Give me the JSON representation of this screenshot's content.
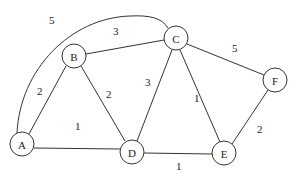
{
  "graph": {
    "nodes": [
      {
        "id": "A",
        "label": "A",
        "x": 22,
        "y": 144
      },
      {
        "id": "B",
        "label": "B",
        "x": 74,
        "y": 56
      },
      {
        "id": "C",
        "label": "C",
        "x": 176,
        "y": 38
      },
      {
        "id": "D",
        "label": "D",
        "x": 132,
        "y": 152
      },
      {
        "id": "E",
        "label": "E",
        "x": 224,
        "y": 153
      },
      {
        "id": "F",
        "label": "F",
        "x": 275,
        "y": 80
      }
    ],
    "edges": [
      {
        "from": "A",
        "to": "C",
        "weight": "5",
        "curved": true
      },
      {
        "from": "A",
        "to": "B",
        "weight": "2"
      },
      {
        "from": "A",
        "to": "D",
        "weight": "1"
      },
      {
        "from": "B",
        "to": "C",
        "weight": "3"
      },
      {
        "from": "B",
        "to": "D",
        "weight": "2"
      },
      {
        "from": "C",
        "to": "D",
        "weight": "3"
      },
      {
        "from": "C",
        "to": "E",
        "weight": "1"
      },
      {
        "from": "C",
        "to": "F",
        "weight": "5"
      },
      {
        "from": "D",
        "to": "E",
        "weight": "1"
      },
      {
        "from": "E",
        "to": "F",
        "weight": "2"
      }
    ]
  }
}
